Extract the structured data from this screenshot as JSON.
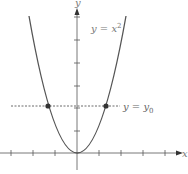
{
  "diagram": {
    "curve_label": "y = x",
    "curve_exponent": "2",
    "line_label": "y = y",
    "line_subscript": "0",
    "x_axis_label": "x",
    "y_axis_label": "y",
    "colors": {
      "curve": "#555555",
      "axis": "#444444",
      "dashed": "#444444",
      "point": "#333333",
      "text": "#777777"
    }
  }
}
